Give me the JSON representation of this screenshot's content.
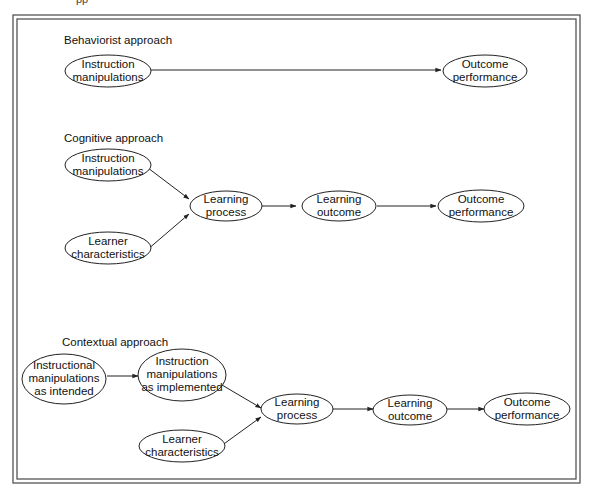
{
  "caption_fragment": "pp",
  "sections": {
    "behaviorist": {
      "title": "Behaviorist approach",
      "nodes": {
        "instruction": [
          "Instruction",
          "manipulations"
        ],
        "outcome": [
          "Outcome",
          "performance"
        ]
      }
    },
    "cognitive": {
      "title": "Cognitive approach",
      "nodes": {
        "instruction": [
          "Instruction",
          "manipulations"
        ],
        "learner": [
          "Learner",
          "characteristics"
        ],
        "process": [
          "Learning",
          "process"
        ],
        "learning_outcome": [
          "Learning",
          "outcome"
        ],
        "outcome": [
          "Outcome",
          "performance"
        ]
      }
    },
    "contextual": {
      "title": "Contextual approach",
      "nodes": {
        "intended": [
          "Instructional",
          "manipulations",
          "as intended"
        ],
        "implemented": [
          "Instruction",
          "manipulations",
          "as implemented"
        ],
        "learner": [
          "Learner",
          "characteristics"
        ],
        "process": [
          "Learning",
          "process"
        ],
        "learning_outcome": [
          "Learning",
          "outcome"
        ],
        "outcome": [
          "Outcome",
          "performance"
        ]
      }
    }
  },
  "edges": [
    {
      "from": "behaviorist.instruction",
      "to": "behaviorist.outcome"
    },
    {
      "from": "cognitive.instruction",
      "to": "cognitive.process"
    },
    {
      "from": "cognitive.learner",
      "to": "cognitive.process"
    },
    {
      "from": "cognitive.process",
      "to": "cognitive.learning_outcome"
    },
    {
      "from": "cognitive.learning_outcome",
      "to": "cognitive.outcome"
    },
    {
      "from": "contextual.intended",
      "to": "contextual.implemented"
    },
    {
      "from": "contextual.implemented",
      "to": "contextual.process"
    },
    {
      "from": "contextual.learner",
      "to": "contextual.process"
    },
    {
      "from": "contextual.process",
      "to": "contextual.learning_outcome"
    },
    {
      "from": "contextual.learning_outcome",
      "to": "contextual.outcome"
    }
  ],
  "colors": {
    "stroke": "#222222",
    "frame": "#555555",
    "background": "#ffffff"
  }
}
